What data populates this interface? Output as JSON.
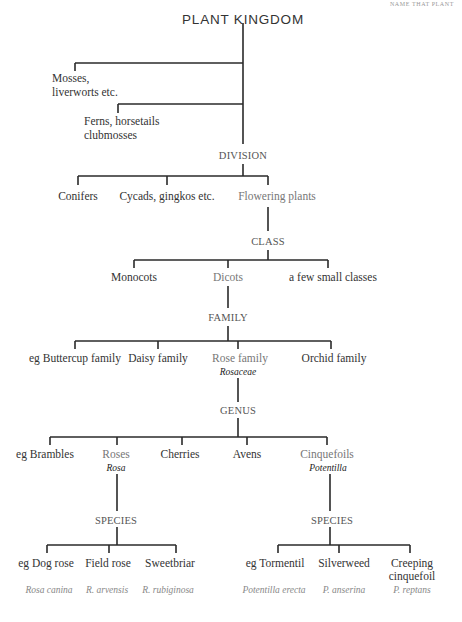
{
  "header": {
    "running_title": "NAME THAT PLANT"
  },
  "title": "PLANT KINGDOM",
  "kingdom_branches": [
    {
      "lines": [
        "Mosses,",
        "liverworts etc."
      ]
    },
    {
      "lines": [
        "Ferns, horsetails",
        "clubmosses"
      ]
    }
  ],
  "ranks": {
    "division": "DIVISION",
    "class": "CLASS",
    "family": "FAMILY",
    "genus": "GENUS",
    "species_left": "SPECIES",
    "species_right": "SPECIES"
  },
  "divisions": [
    "Conifers",
    "Cycads, gingkos etc.",
    "Flowering plants"
  ],
  "classes": [
    "Monocots",
    "Dicots",
    "a few small classes"
  ],
  "families": [
    {
      "name": "eg Buttercup family"
    },
    {
      "name": "Daisy family"
    },
    {
      "name": "Rose family",
      "latin": "Rosaceae"
    },
    {
      "name": "Orchid family"
    }
  ],
  "genera": [
    {
      "name": "eg Brambles"
    },
    {
      "name": "Roses",
      "latin": "Rosa"
    },
    {
      "name": "Cherries"
    },
    {
      "name": "Avens"
    },
    {
      "name": "Cinquefoils",
      "latin": "Potentilla"
    }
  ],
  "species_rosa": [
    {
      "name": "eg Dog rose",
      "latin": "Rosa canina"
    },
    {
      "name": "Field rose",
      "latin": "R. arvensis"
    },
    {
      "name": "Sweetbriar",
      "latin": "R. rubiginosa"
    }
  ],
  "species_potentilla": [
    {
      "name": "eg Tormentil",
      "latin": "Potentilla erecta"
    },
    {
      "name": "Silverweed",
      "latin": "P. anserina"
    },
    {
      "name": "Creeping",
      "name2": "cinquefoil",
      "latin": "P. reptans"
    }
  ],
  "colors": {
    "line": "#2a2a2a",
    "text": "#333333",
    "highlight_path": "#777777"
  }
}
